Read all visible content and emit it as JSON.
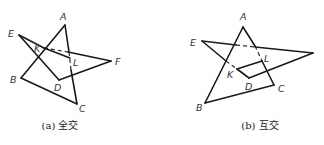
{
  "figures": [
    {
      "id": "a",
      "caption": "(a) 全交",
      "vertices": {
        "A": [
          65,
          25
        ],
        "B": [
          21,
          78
        ],
        "C": [
          77,
          104
        ],
        "D": [
          59,
          80
        ],
        "E": [
          19,
          35
        ],
        "F": [
          111,
          61
        ],
        "K": [
          44,
          48
        ],
        "L": [
          70,
          58
        ]
      },
      "labels": {
        "A": "A",
        "B": "B",
        "C": "C",
        "D": "D",
        "E": "E",
        "F": "F",
        "K": "K",
        "L": "L"
      }
    },
    {
      "id": "b",
      "caption": "(b) 互交",
      "vertices": {
        "A": [
          243,
          27
        ],
        "B": [
          205,
          103
        ],
        "C": [
          274,
          85
        ],
        "D": [
          249,
          78
        ],
        "E": [
          202,
          41
        ],
        "F": [
          313,
          53
        ],
        "K": [
          237,
          69
        ],
        "L": [
          262,
          61
        ]
      },
      "labels": {
        "A": "A",
        "B": "B",
        "C": "C",
        "D": "D",
        "E": "E",
        "K": "K",
        "L": "L"
      }
    }
  ]
}
